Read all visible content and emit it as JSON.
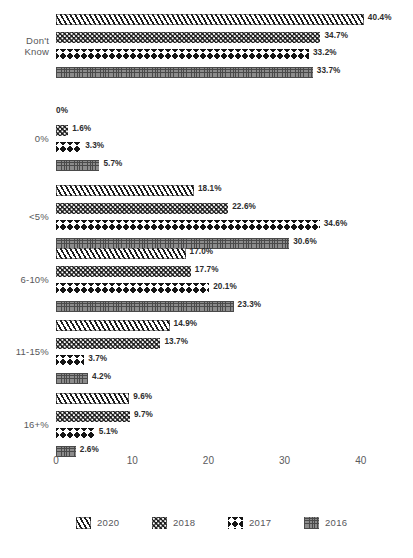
{
  "title_sliver": "",
  "chart_data": {
    "type": "bar",
    "orientation": "horizontal",
    "title": "",
    "subtitle": "",
    "xlabel": "",
    "ylabel": "",
    "xlim": [
      0,
      44
    ],
    "xticks": [
      0,
      10,
      20,
      30,
      40
    ],
    "xtick_labels": [
      "0",
      "10",
      "20",
      "30",
      "40"
    ],
    "grid": false,
    "legend_position": "bottom",
    "value_suffix": "%",
    "categories": [
      "Don't Know",
      "0%",
      "<5%",
      "6-10%",
      "11-15%",
      "16+%"
    ],
    "series": [
      {
        "name": "2020",
        "pattern": "diagonal-stripes",
        "values": [
          40.4,
          0,
          18.1,
          17.0,
          14.9,
          9.6
        ],
        "labels": [
          "40.4%",
          "0%",
          "18.1%",
          "17.0%",
          "14.9%",
          "9.6%"
        ]
      },
      {
        "name": "2018",
        "pattern": "dots",
        "values": [
          34.7,
          1.6,
          22.6,
          17.7,
          13.7,
          9.7
        ],
        "labels": [
          "34.7%",
          "1.6%",
          "22.6%",
          "17.7%",
          "13.7%",
          "9.7%"
        ]
      },
      {
        "name": "2017",
        "pattern": "zigzag",
        "values": [
          33.2,
          3.3,
          34.6,
          20.1,
          3.7,
          5.1
        ],
        "labels": [
          "33.2%",
          "3.3%",
          "34.6%",
          "20.1%",
          "3.7%",
          "5.1%"
        ]
      },
      {
        "name": "2016",
        "pattern": "grid-crosshatch",
        "values": [
          33.7,
          5.7,
          30.6,
          23.3,
          4.2,
          2.6
        ],
        "labels": [
          "33.7%",
          "5.7%",
          "30.6%",
          "23.3%",
          "4.2%",
          "2.6%"
        ]
      }
    ]
  },
  "legend": {
    "items": [
      {
        "label": "2020",
        "pattern": "diagonal-stripes"
      },
      {
        "label": "2018",
        "pattern": "dots"
      },
      {
        "label": "2017",
        "pattern": "zigzag"
      },
      {
        "label": "2016",
        "pattern": "grid-crosshatch"
      }
    ]
  },
  "colors": {
    "ink": "#1c1c1c",
    "label_text": "#2c2c2c",
    "axis_text": "#5a5a5c",
    "category_text": "#58585a",
    "grid_gray": "#8c8c8c",
    "background": "#ffffff"
  }
}
